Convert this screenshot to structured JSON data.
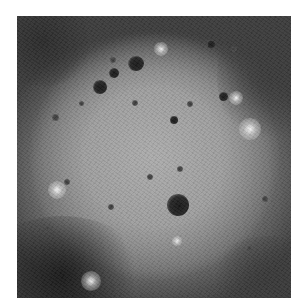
{
  "image": {
    "description": "Grayscale orbital photograph of a large, flat-floored lunar/planetary impact basin with scattered small craters",
    "colors": {
      "floor": "#a5a5a5",
      "rim_dark": "#3a3a3a",
      "crater_dark": "#1c1c1c",
      "highlight": "#f0f0f0"
    }
  }
}
